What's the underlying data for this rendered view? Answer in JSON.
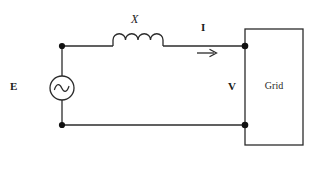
{
  "diagram": {
    "stroke_color": "#2b2b2b",
    "background_color": "#ffffff",
    "node_color": "#111111"
  },
  "labels": {
    "source": "E",
    "reactance": "X",
    "current": "I",
    "voltage": "V",
    "grid": "Grid"
  },
  "components": {
    "ac_source": {
      "name": "ac-voltage-source",
      "symbol": "circle-with-sine-wave",
      "center_x": 62,
      "center_y": 88,
      "radius": 12
    },
    "inductor": {
      "name": "inductor-reactance",
      "symbol": "four-coil-humps",
      "start_x": 113,
      "end_x": 163,
      "baseline_y": 46,
      "coils": 4
    },
    "grid_block": {
      "name": "grid-block",
      "x": 245,
      "y": 29,
      "width": 58,
      "height": 116
    },
    "current_arrow": {
      "name": "current-direction-arrow",
      "direction": "right",
      "x1": 197,
      "x2": 217,
      "y": 53
    }
  },
  "wires": {
    "top_y": 46,
    "bottom_y": 125,
    "left_x": 62,
    "right_x": 245
  },
  "nodes": [
    {
      "name": "node-top-left",
      "x": 62,
      "y": 46
    },
    {
      "name": "node-bottom-left",
      "x": 62,
      "y": 125
    },
    {
      "name": "node-top-right",
      "x": 245,
      "y": 46
    },
    {
      "name": "node-bottom-right",
      "x": 245,
      "y": 125
    }
  ]
}
